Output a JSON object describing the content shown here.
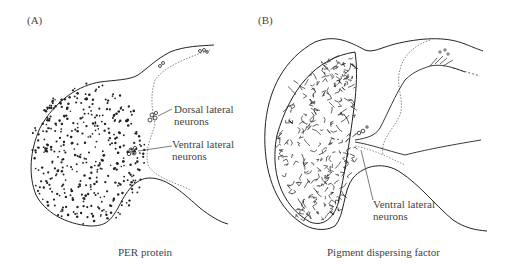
{
  "figure": {
    "panels": [
      {
        "id": "A",
        "letter": "(A)",
        "caption": "PER protein",
        "annotations": [
          {
            "line1": "Dorsal lateral",
            "line2": "neurons"
          },
          {
            "line1": "Ventral lateral",
            "line2": "neurons"
          }
        ]
      },
      {
        "id": "B",
        "letter": "(B)",
        "caption": "Pigment dispersing factor",
        "annotations": [
          {
            "line1": "Ventral lateral",
            "line2": "neurons"
          }
        ]
      }
    ]
  }
}
